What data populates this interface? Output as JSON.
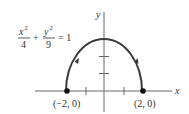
{
  "figure": {
    "equation": {
      "num1": "x",
      "sup1": "2",
      "den1": "4",
      "plus": "+",
      "num2": "y",
      "sup2": "2",
      "den2": "9",
      "rhs": "= 1"
    },
    "axes": {
      "x_label": "x",
      "y_label": "y"
    },
    "points": [
      {
        "label": "(−2, 0)",
        "x": -2,
        "y": 0
      },
      {
        "label": "(2, 0)",
        "x": 2,
        "y": 0
      }
    ],
    "curve": "upper half of ellipse x^2/4 + y^2/9 = 1, traversed counterclockwise from (2, 0) to (-2, 0)",
    "colors": {
      "curve": "#3a3a3a",
      "axes": "#555555",
      "points": "#111111"
    }
  }
}
